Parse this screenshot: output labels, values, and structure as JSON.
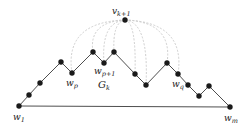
{
  "diagram": {
    "colors": {
      "edge": "#3a3a3a",
      "node": "#1a1a1a",
      "dashed": "#c8c8c8",
      "background": "#ffffff"
    },
    "apex": {
      "id": "v_k+1",
      "label_base": "v",
      "label_sub": "k+1",
      "x": 125,
      "y": 20
    },
    "nodes": [
      {
        "id": "w1",
        "x": 19,
        "y": 106,
        "label_base": "w",
        "label_sub": "1"
      },
      {
        "id": "n2",
        "x": 29,
        "y": 95
      },
      {
        "id": "n3",
        "x": 40,
        "y": 83
      },
      {
        "id": "n4",
        "x": 61,
        "y": 62
      },
      {
        "id": "wp",
        "x": 72,
        "y": 73,
        "label_base": "w",
        "label_sub": "p"
      },
      {
        "id": "n6",
        "x": 93,
        "y": 52
      },
      {
        "id": "wp+1",
        "x": 104,
        "y": 63,
        "label_base": "w",
        "label_sub": "p+1"
      },
      {
        "id": "n8",
        "x": 114,
        "y": 52
      },
      {
        "id": "n9",
        "x": 135,
        "y": 74
      },
      {
        "id": "n10",
        "x": 146,
        "y": 85
      },
      {
        "id": "n11",
        "x": 167,
        "y": 63
      },
      {
        "id": "wq",
        "x": 178,
        "y": 74,
        "label_base": "w",
        "label_sub": "q"
      },
      {
        "id": "n13",
        "x": 188,
        "y": 85
      },
      {
        "id": "n14",
        "x": 199,
        "y": 96
      },
      {
        "id": "n15",
        "x": 209,
        "y": 86
      },
      {
        "id": "wm",
        "x": 230,
        "y": 107,
        "label_base": "w",
        "label_sub": "m"
      }
    ],
    "dashed_targets": [
      "wp",
      "n6",
      "wp+1",
      "n8",
      "n9",
      "n10",
      "n11",
      "wq"
    ],
    "region_label": {
      "base": "G",
      "sub": "k",
      "x": 100,
      "y": 86
    },
    "labels": {
      "apex": "v",
      "apex_sub": "k+1",
      "w1": "w",
      "w1_sub": "1",
      "wp": "w",
      "wp_sub": "p",
      "wp1": "w",
      "wp1_sub": "p+1",
      "wq": "w",
      "wq_sub": "q",
      "wm": "w",
      "wm_sub": "m",
      "region": "G",
      "region_sub": "k"
    }
  }
}
